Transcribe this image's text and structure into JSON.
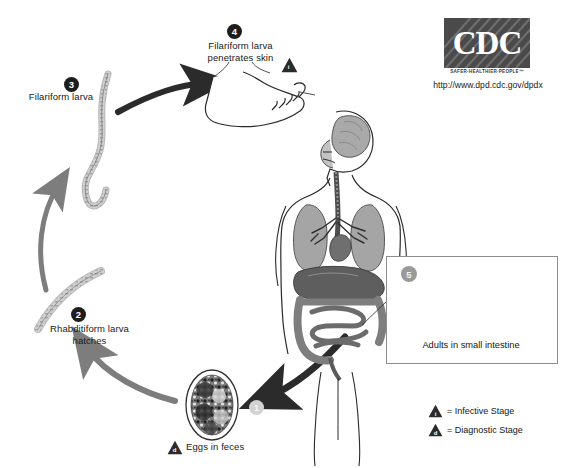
{
  "diagram": {
    "source_logo": {
      "brand": "CDC",
      "tagline": "SAFER·HEALTHIER·PEOPLE™",
      "url": "http://www.dpd.cdc.gov/dpdx"
    },
    "steps": [
      {
        "number": "1",
        "badge_style": "gray",
        "label": "Eggs in feces",
        "marker": "d"
      },
      {
        "number": "2",
        "badge_style": "dark",
        "label": "Rhabditiform larva\nhatches",
        "line1": "Rhabditiform larva",
        "line2": "hatches"
      },
      {
        "number": "3",
        "badge_style": "dark",
        "label": "Filariform larva",
        "line1": "Filariform larva",
        "line2": ""
      },
      {
        "number": "4",
        "badge_style": "dark",
        "label": "Filariform larva\npenetrates skin",
        "line1": "Filariform larva",
        "line2": "penetrates skin",
        "marker": "i"
      },
      {
        "number": "5",
        "badge_style": "inset",
        "label": "Adults in small intestine"
      }
    ],
    "inset": {
      "caption": "Adults in small intestine",
      "number": "5"
    },
    "legend": [
      {
        "marker": "i",
        "text": "= Infective Stage"
      },
      {
        "marker": "d",
        "text": "= Diagnostic Stage"
      }
    ],
    "colors": {
      "arrow_dark": "#2b2b2b",
      "arrow_gray": "#7d7d7d",
      "badge_dark": "#1d1d1d",
      "badge_gray": "#d2d2d2",
      "logo_bg": "#4a4a4a",
      "organ_light": "#b9b9b9",
      "organ_mid": "#8e8e8e",
      "organ_dark": "#5a5a5a",
      "outline": "#2a2a2a"
    }
  }
}
